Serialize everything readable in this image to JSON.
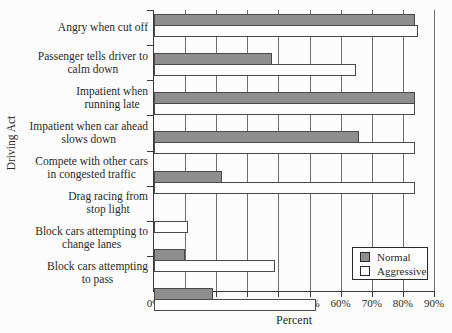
{
  "chart_data": {
    "type": "bar",
    "orientation": "horizontal",
    "title": "",
    "xlabel": "Percent",
    "ylabel": "Driving Act",
    "xlim": [
      0,
      90
    ],
    "xticks": [
      "0%",
      "10%",
      "20%",
      "30%",
      "40%",
      "50%",
      "60%",
      "70%",
      "80%",
      "90%"
    ],
    "grid": true,
    "legend_position": "bottom-right",
    "categories": [
      "Angry when cut off",
      "Passenger tells driver to\ncalm down",
      "Impatient when\nrunning late",
      "Impatient when car ahead\nslows down",
      "Compete with other cars\nin congested traffic",
      "Drag racing from\nstop light",
      "Block cars attempting to\nchange lanes",
      "Block cars attempting\nto pass"
    ],
    "series": [
      {
        "name": "Normal",
        "values": [
          84,
          38,
          84,
          66,
          22,
          0,
          10,
          19
        ],
        "fill": "#8e8e8e"
      },
      {
        "name": "Aggressive",
        "values": [
          85,
          65,
          84,
          84,
          84,
          11,
          39,
          52
        ],
        "fill": "#fdfdfd"
      }
    ]
  },
  "colors": {
    "normal_fill": "#8e8e8e",
    "aggressive_fill": "#fdfdfd",
    "bar_border": "#4a4a4a",
    "axis": "#3a3a3a",
    "gridline": "#6e6e6e",
    "text": "#2a2a2a",
    "background": "#fcfcfc"
  }
}
